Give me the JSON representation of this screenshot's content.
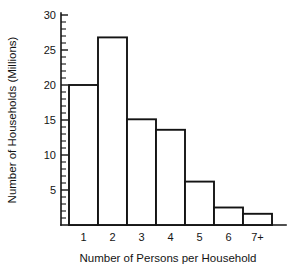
{
  "chart_data": {
    "type": "bar",
    "title": "",
    "xlabel": "Number of Persons per Household",
    "ylabel": "Number of Households (Millions)",
    "categories": [
      "1",
      "2",
      "3",
      "4",
      "5",
      "6",
      "7+"
    ],
    "values": [
      20.0,
      26.8,
      15.1,
      13.6,
      6.2,
      2.5,
      1.6
    ],
    "ylim": [
      0,
      30
    ],
    "xlim": [
      0.5,
      7.5
    ],
    "ytick_labels": [
      "5",
      "10",
      "15",
      "20",
      "25",
      "30"
    ],
    "ytick_values": [
      5,
      10,
      15,
      20,
      25,
      30
    ],
    "yminor_interval": 1,
    "grid": false,
    "legend": null,
    "bar_style": "outline-only-white-fill",
    "axes_shown": [
      "left",
      "bottom"
    ],
    "colors": {
      "ink": "#141414",
      "background": "#ffffff",
      "bar_fill": "#ffffff"
    }
  },
  "figure": {
    "caption": ""
  }
}
